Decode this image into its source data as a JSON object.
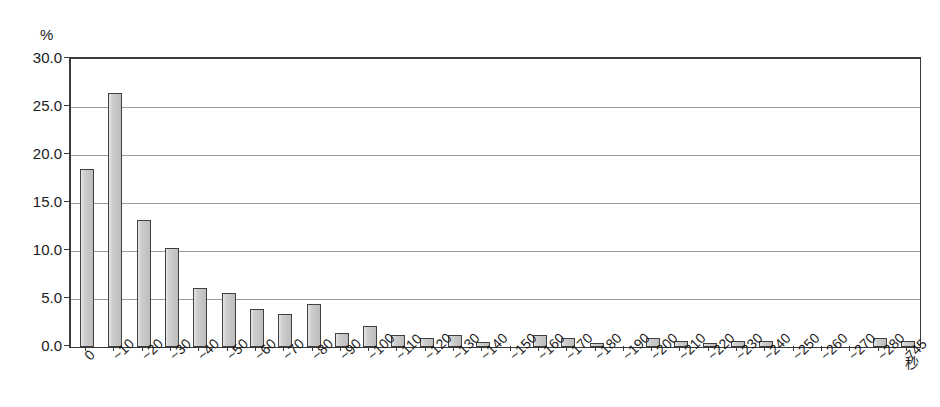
{
  "chart_data": {
    "type": "bar",
    "title": "",
    "subtitle": "",
    "xlabel": "秒",
    "ylabel": "%",
    "ylim": [
      0.0,
      30.0
    ],
    "ytick_step": 5.0,
    "ytick_labels": [
      "0.0",
      "5.0",
      "10.0",
      "15.0",
      "20.0",
      "25.0",
      "30.0"
    ],
    "ytick_values": [
      0.0,
      5.0,
      10.0,
      15.0,
      20.0,
      25.0,
      30.0
    ],
    "grid": true,
    "grid_axis": "y",
    "legend": false,
    "legend_position": "none",
    "bar_fill_color": "#c9c9c9",
    "bar_edge_color": "#404040",
    "axis_color": "#3a3a3a",
    "grid_color": "#9a9a9a",
    "categories": [
      "0",
      "~10",
      "~20",
      "~30",
      "~40",
      "~50",
      "~60",
      "~70",
      "~80",
      "~90",
      "~100",
      "~110",
      "~120",
      "~130",
      "~140",
      "~150",
      "~160",
      "~170",
      "~180",
      "~190",
      "~200",
      "~210",
      "~220",
      "~230",
      "~240",
      "~250",
      "~260",
      "~270",
      "~280",
      "745"
    ],
    "values": [
      18.5,
      26.5,
      13.2,
      10.3,
      6.1,
      5.6,
      4.0,
      3.4,
      4.5,
      1.5,
      2.2,
      1.2,
      0.9,
      1.2,
      0.5,
      0.0,
      1.2,
      0.9,
      0.4,
      0.0,
      0.9,
      0.6,
      0.4,
      0.6,
      0.6,
      0.0,
      0.0,
      0.0,
      0.9,
      0.6
    ]
  }
}
